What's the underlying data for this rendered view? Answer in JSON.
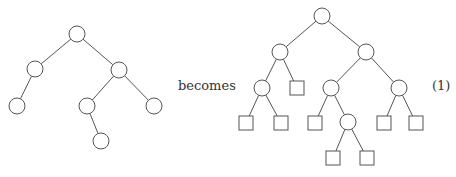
{
  "diagram": {
    "connector_text": "becomes",
    "equation_number": "(1)",
    "stroke_color": "#555555",
    "left_tree": {
      "description": "binary tree with internal nodes only",
      "nodes": [
        {
          "id": "a",
          "x": 77,
          "y": 34,
          "shape": "circle"
        },
        {
          "id": "b",
          "x": 35,
          "y": 69,
          "shape": "circle"
        },
        {
          "id": "c",
          "x": 119,
          "y": 70,
          "shape": "circle"
        },
        {
          "id": "d",
          "x": 17,
          "y": 106,
          "shape": "circle"
        },
        {
          "id": "e",
          "x": 87,
          "y": 106,
          "shape": "circle"
        },
        {
          "id": "f",
          "x": 154,
          "y": 106,
          "shape": "circle"
        },
        {
          "id": "g",
          "x": 101,
          "y": 141,
          "shape": "circle"
        }
      ],
      "edges": [
        [
          "a",
          "b"
        ],
        [
          "a",
          "c"
        ],
        [
          "b",
          "d"
        ],
        [
          "c",
          "e"
        ],
        [
          "c",
          "f"
        ],
        [
          "e",
          "g"
        ]
      ]
    },
    "right_tree": {
      "description": "extended binary tree with external (square) nodes",
      "nodes": [
        {
          "id": "A",
          "x": 322,
          "y": 16,
          "shape": "circle"
        },
        {
          "id": "B",
          "x": 280,
          "y": 52,
          "shape": "circle"
        },
        {
          "id": "C",
          "x": 366,
          "y": 52,
          "shape": "circle"
        },
        {
          "id": "D",
          "x": 262,
          "y": 88,
          "shape": "circle"
        },
        {
          "id": "s1",
          "x": 297,
          "y": 88,
          "shape": "square"
        },
        {
          "id": "E",
          "x": 331,
          "y": 88,
          "shape": "circle"
        },
        {
          "id": "F",
          "x": 399,
          "y": 88,
          "shape": "circle"
        },
        {
          "id": "s2",
          "x": 246,
          "y": 123,
          "shape": "square"
        },
        {
          "id": "s3",
          "x": 281,
          "y": 123,
          "shape": "square"
        },
        {
          "id": "s4",
          "x": 315,
          "y": 123,
          "shape": "square"
        },
        {
          "id": "G",
          "x": 348,
          "y": 122,
          "shape": "circle"
        },
        {
          "id": "s5",
          "x": 384,
          "y": 123,
          "shape": "square"
        },
        {
          "id": "s6",
          "x": 416,
          "y": 123,
          "shape": "square"
        },
        {
          "id": "s7",
          "x": 333,
          "y": 158,
          "shape": "square"
        },
        {
          "id": "s8",
          "x": 367,
          "y": 158,
          "shape": "square"
        }
      ],
      "edges": [
        [
          "A",
          "B"
        ],
        [
          "A",
          "C"
        ],
        [
          "B",
          "D"
        ],
        [
          "B",
          "s1"
        ],
        [
          "C",
          "E"
        ],
        [
          "C",
          "F"
        ],
        [
          "D",
          "s2"
        ],
        [
          "D",
          "s3"
        ],
        [
          "E",
          "s4"
        ],
        [
          "E",
          "G"
        ],
        [
          "F",
          "s5"
        ],
        [
          "F",
          "s6"
        ],
        [
          "G",
          "s7"
        ],
        [
          "G",
          "s8"
        ]
      ]
    }
  }
}
